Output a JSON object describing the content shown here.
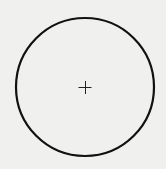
{
  "diagram": {
    "shape": "circle",
    "center": [
      85,
      87
    ],
    "radius": 69,
    "stroke_color": "#111111",
    "background_color": "#f0f0ef",
    "center_mark": "plus",
    "center_mark_size": 6
  }
}
